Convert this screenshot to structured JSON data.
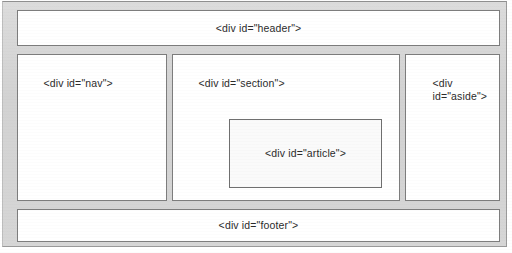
{
  "diagram": {
    "frame": {
      "background_color": "#d3d3d3",
      "border_color": "#9a9a9a"
    },
    "boxes": {
      "header": {
        "label": "<div id=\"header\">",
        "align": "center",
        "fill": "#ffffff"
      },
      "nav": {
        "label": "<div id=\"nav\">",
        "align": "top-left",
        "fill": "#ffffff"
      },
      "section": {
        "label": "<div id=\"section\">",
        "align": "top-left",
        "fill": "#ffffff"
      },
      "article": {
        "label": "<div id=\"article\">",
        "align": "center",
        "fill": "#fafafa"
      },
      "aside": {
        "label": "<div\nid=\"aside\">",
        "align": "top-left",
        "fill": "#ffffff"
      },
      "footer": {
        "label": "<div id=\"footer\">",
        "align": "center",
        "fill": "#ffffff"
      }
    }
  }
}
